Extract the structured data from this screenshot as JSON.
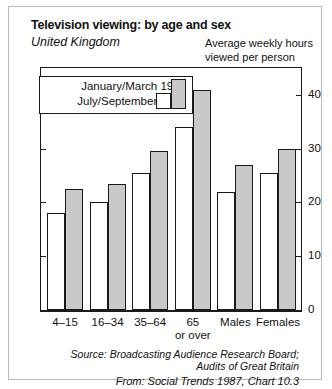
{
  "title": "Television viewing: by age and sex",
  "subtitle": "United Kingdom",
  "unit_line1": "Average weekly hours",
  "unit_line2": "viewed per person",
  "legend": {
    "item1": "January/March 1986",
    "item2": "July/September 1985",
    "swatch1_name": "shaded-swatch",
    "swatch2_name": "open-swatch"
  },
  "source": {
    "line1": "Source: Broadcasting Audience Research Board;",
    "line2": "Audits of Great Britain",
    "line3": "From: Social Trends 1987, Chart 10.3"
  },
  "xlabels": [
    {
      "label": "4–15",
      "sub": ""
    },
    {
      "label": "16–34",
      "sub": ""
    },
    {
      "label": "35–64",
      "sub": ""
    },
    {
      "label": "65",
      "sub": "or over"
    },
    {
      "label": "Males",
      "sub": ""
    },
    {
      "label": "Females",
      "sub": ""
    }
  ],
  "yticks": [
    "40",
    "30",
    "20",
    "10",
    "0"
  ],
  "chart_data": {
    "type": "bar",
    "title": "Television viewing: by age and sex",
    "subtitle": "United Kingdom",
    "xlabel": "",
    "ylabel": "Average weekly hours viewed per person",
    "ylim": [
      0,
      45
    ],
    "yticks": [
      0,
      10,
      20,
      30,
      40
    ],
    "grid": false,
    "legend_position": "top-left",
    "categories": [
      "4–15",
      "16–34",
      "35–64",
      "65 or over",
      "Males",
      "Females"
    ],
    "series": [
      {
        "name": "July/September 1985",
        "style": "open",
        "values": [
          18.0,
          20.0,
          25.5,
          34.0,
          22.0,
          25.5
        ]
      },
      {
        "name": "January/March 1986",
        "style": "shaded",
        "values": [
          22.5,
          23.5,
          29.5,
          41.0,
          27.0,
          30.0
        ]
      }
    ],
    "source": "Broadcasting Audience Research Board; Audits of Great Britain",
    "from": "Social Trends 1987, Chart 10.3"
  }
}
